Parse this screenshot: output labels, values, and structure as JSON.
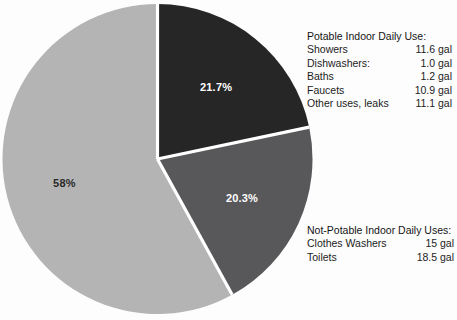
{
  "chart_data": {
    "type": "pie",
    "title": "",
    "categories": [
      "Potable Indoor Daily Use",
      "Toilets",
      "Clothes Washers and other"
    ],
    "values": [
      21.7,
      20.3,
      58
    ],
    "value_labels": [
      "21.7%",
      "20.3%",
      "58%"
    ],
    "slice_colors": [
      "#262626",
      "#58585a",
      "#b4b4b4"
    ],
    "label_text_colors": [
      "#ffffff",
      "#ffffff",
      "#2a2a2a"
    ],
    "start_angle_deg": 0,
    "direction": "clockwise",
    "units": "gal",
    "legend_position": "right",
    "grid": false,
    "background": "#fdfdfd"
  },
  "pie": {
    "slices": [
      {
        "label": "21.7%",
        "percent": 21.7,
        "color": "#262626",
        "text_color": "#ffffff"
      },
      {
        "label": "20.3%",
        "percent": 20.3,
        "color": "#58585a",
        "text_color": "#ffffff"
      },
      {
        "label": "58%",
        "percent": 58,
        "color": "#b4b4b4",
        "text_color": "#2a2a2a"
      }
    ]
  },
  "legends": {
    "potable": {
      "title": "Potable Indoor Daily Use:",
      "rows": [
        {
          "name": "Showers",
          "value": "11.6 gal"
        },
        {
          "name": "Dishwashers:",
          "value": "1.0 gal"
        },
        {
          "name": "Baths",
          "value": "1.2 gal"
        },
        {
          "name": "Faucets",
          "value": "10.9 gal"
        },
        {
          "name": "Other uses, leaks",
          "value": "11.1 gal"
        }
      ]
    },
    "not_potable": {
      "title": "Not-Potable Indoor Daily Uses:",
      "rows": [
        {
          "name": "Clothes Washers",
          "value": "15 gal"
        },
        {
          "name": "Toilets",
          "value": "18.5 gal"
        }
      ]
    }
  }
}
